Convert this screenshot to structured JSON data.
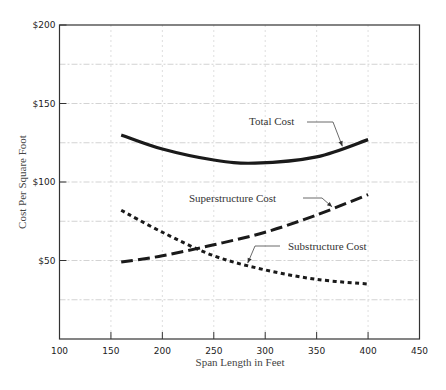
{
  "chart_data": {
    "type": "line",
    "title": "",
    "xlabel": "Span Length in Feet",
    "ylabel": "Cost Per Square Foot",
    "xlim": [
      100,
      450
    ],
    "ylim": [
      0,
      200
    ],
    "x_ticks": [
      100,
      150,
      200,
      250,
      300,
      350,
      400,
      450
    ],
    "y_ticks": [
      {
        "value": 50,
        "label": "$50"
      },
      {
        "value": 100,
        "label": "$100"
      },
      {
        "value": 150,
        "label": "$150"
      },
      {
        "value": 200,
        "label": "$200"
      }
    ],
    "grid": {
      "x_every": 50,
      "y_every": 25,
      "style": "dashed-light"
    },
    "legend": "inline-annotations",
    "series": [
      {
        "name": "Total Cost",
        "style": "solid-thick",
        "x": [
          160,
          200,
          250,
          290,
          350,
          400
        ],
        "values": [
          130,
          121,
          114,
          112,
          116,
          127
        ]
      },
      {
        "name": "Superstructure Cost",
        "style": "long-dash",
        "x": [
          160,
          200,
          250,
          300,
          350,
          400
        ],
        "values": [
          49,
          53,
          60,
          68,
          79,
          92
        ]
      },
      {
        "name": "Substructure Cost",
        "style": "short-dash",
        "x": [
          160,
          200,
          250,
          300,
          350,
          400
        ],
        "values": [
          82,
          68,
          53,
          44,
          38,
          35
        ]
      }
    ],
    "annotations": [
      {
        "text": "Total Cost",
        "points_to_series": "Total Cost",
        "at_x": 375
      },
      {
        "text": "Superstructure Cost",
        "points_to_series": "Superstructure Cost",
        "at_x": 365
      },
      {
        "text": "Substructure Cost",
        "points_to_series": "Substructure Cost",
        "at_x": 283
      }
    ]
  }
}
